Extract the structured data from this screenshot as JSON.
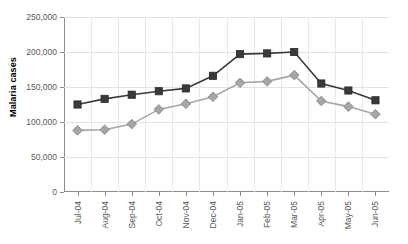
{
  "chart_data": {
    "type": "line",
    "title": "",
    "xlabel": "",
    "ylabel": "Malaria cases",
    "categories": [
      "Jul-04",
      "Aug-04",
      "Sep-04",
      "Oct-04",
      "Nov-04",
      "Dec-04",
      "Jan-05",
      "Feb-05",
      "Mar-05",
      "Apr-05",
      "May-05",
      "Jun-05"
    ],
    "series": [
      {
        "name": "dark-squares",
        "marker": "square",
        "color": "#3a3a3a",
        "values": [
          125000,
          133000,
          139000,
          144000,
          148000,
          166000,
          197000,
          198000,
          200000,
          155000,
          145000,
          131000
        ]
      },
      {
        "name": "light-diamonds",
        "marker": "diamond",
        "color": "#a6a6a6",
        "values": [
          88000,
          89000,
          97000,
          118000,
          126000,
          136000,
          156000,
          158000,
          167000,
          130000,
          122000,
          111000
        ]
      }
    ],
    "ylim": [
      0,
      250000
    ],
    "yticks": [
      0,
      50000,
      100000,
      150000,
      200000,
      250000
    ],
    "ytick_labels": [
      "0",
      "50,000",
      "100,000",
      "150,000",
      "200,000",
      "250,000"
    ],
    "grid": "horizontal-and-vertical",
    "legend": "none"
  }
}
